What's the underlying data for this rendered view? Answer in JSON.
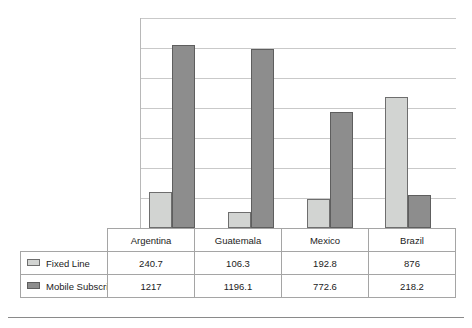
{
  "chart_data": {
    "type": "bar",
    "title": "",
    "subtitle": "",
    "xlabel": "",
    "ylabel": "",
    "grid": true,
    "gridline_count": 7,
    "ylim": [
      0,
      1400
    ],
    "ytick_step": 200,
    "ytick_labels_visible": false,
    "legend_position": "table-left-column",
    "categories": [
      "Argentina",
      "Guatemala",
      "Mexico",
      "Brazil"
    ],
    "series": [
      {
        "name": "Fixed Line",
        "color": "#d2d4d2",
        "swatch": "light",
        "values": [
          240.7,
          106.3,
          192.8,
          876
        ],
        "value_labels": [
          "240.7",
          "106.3",
          "192.8",
          "876"
        ]
      },
      {
        "name": "Mobile Subscriptions",
        "color": "#8d8d8d",
        "swatch": "dark",
        "values": [
          1217,
          1196.1,
          772.6,
          218.2
        ],
        "value_labels": [
          "1217",
          "1196.1",
          "772.6",
          "218.2"
        ]
      }
    ]
  },
  "table": {
    "corner_cell": "",
    "column_headers": [
      "Argentina",
      "Guatemala",
      "Mexico",
      "Brazil"
    ],
    "rows": [
      {
        "series_label": "Fixed Line",
        "swatch": "light",
        "cells": [
          "240.7",
          "106.3",
          "192.8",
          "876"
        ]
      },
      {
        "series_label": "Mobile Subscriptions",
        "swatch": "dark",
        "cells": [
          "1217",
          "1196.1",
          "772.6",
          "218.2"
        ]
      }
    ]
  },
  "colors": {
    "fixed_line": "#d2d4d2",
    "mobile_subscriptions": "#8d8d8d",
    "gridline": "#c9c9c9",
    "border": "#a5a5a5"
  }
}
